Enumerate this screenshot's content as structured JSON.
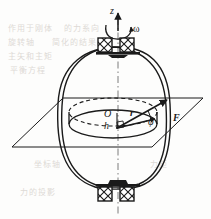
{
  "figure": {
    "kind": "engineering-mechanics-diagram",
    "width": 211,
    "height": 219,
    "background_color": "#fdfdfc",
    "ink_color": "#1a1a1a"
  },
  "labels": {
    "axis_z": "z",
    "angular_velocity": "ω",
    "origin": "O",
    "radius": "r",
    "height": "h",
    "angle": "φ",
    "force": "F"
  },
  "elements": {
    "axis": {
      "name": "vertical rotation axis",
      "style": "dash-dot center line",
      "x": 118,
      "top_y": 18,
      "bottom_y": 214
    },
    "bearings": [
      {
        "name": "top-bearing",
        "y": 44,
        "count": 2,
        "glyph": "crossed-square"
      },
      {
        "name": "bottom-bearing",
        "y": 190,
        "count": 2,
        "glyph": "crossed-square"
      }
    ],
    "body": {
      "name": "rotating body outline",
      "shape": "double-line barrel / ellipsoid",
      "center_x": 112,
      "center_y": 118,
      "rx": 55,
      "ry": 72
    },
    "plane": {
      "name": "horizontal reference plane",
      "shape": "parallelogram",
      "points": "12,147 63,98 203,98 152,147"
    },
    "disk": {
      "name": "central cylindrical disk",
      "top_ellipse_style": "dashed",
      "bottom_ellipse_style": "solid",
      "center_x": 113,
      "top_y": 112,
      "bottom_y": 124,
      "rx": 44,
      "ry": 14
    },
    "vectors": [
      {
        "name": "force-vector-F",
        "from": "117,128",
        "to": "166,100",
        "arrow": true,
        "bold": true
      },
      {
        "name": "radius-vector-r",
        "from": "117,128",
        "to": "156,119",
        "arrow": true,
        "bold": true
      }
    ],
    "angle_arc": {
      "name": "phi-angle-arc",
      "between": [
        "radius-vector-r",
        "force-vector-F"
      ]
    },
    "right_angle_marker": {
      "name": "right-angle-marker",
      "x": 118,
      "y": 124
    },
    "rotation_arrow": {
      "name": "omega-rotation-arrow",
      "style": "curved arrow around z axis"
    }
  },
  "bleed_through_text": [
    {
      "text": "作用于刚体",
      "x": 8,
      "y": 22
    },
    {
      "text": "的力系向",
      "x": 64,
      "y": 22
    },
    {
      "text": "旋转轴",
      "x": 8,
      "y": 36
    },
    {
      "text": "简化的结果",
      "x": 52,
      "y": 36
    },
    {
      "text": "主矢和主矩",
      "x": 8,
      "y": 50
    },
    {
      "text": "平衡方程",
      "x": 10,
      "y": 64
    },
    {
      "text": "坐标轴",
      "x": 34,
      "y": 158
    },
    {
      "text": "力的投影",
      "x": 20,
      "y": 186
    },
    {
      "text": "力矩",
      "x": 150,
      "y": 158
    }
  ]
}
